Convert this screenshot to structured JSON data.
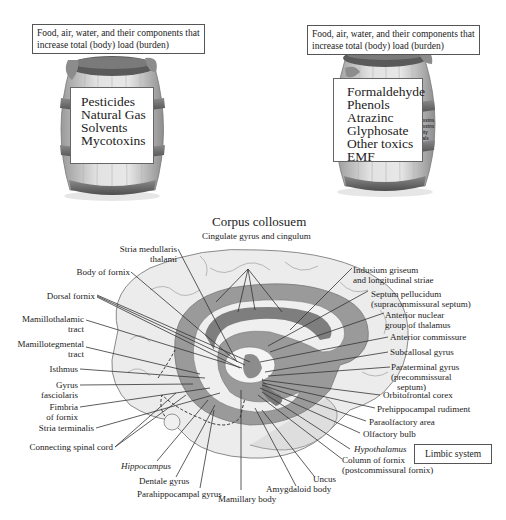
{
  "barrels": [
    {
      "caption": [
        "Food, air, water, and their components that",
        "increase total (body) load (burden)"
      ],
      "items": [
        "Pesticides",
        "Natural Gas",
        "Solvents",
        "Mycotoxins"
      ]
    },
    {
      "caption": [
        "Food, air, water, and their components that",
        "increase total (body) load (burden)"
      ],
      "items": [
        "Formaldehyde",
        "Phenols",
        "Atrazinc",
        "Glyphosate",
        "Other toxics",
        "EMF"
      ],
      "hidden_fragments": [
        "Toxins",
        "Toxins",
        "vity",
        "cals"
      ]
    }
  ],
  "brain": {
    "title": "Corpus collosuem",
    "subtitle": "Cingulate gyrus and cingulum",
    "legend": "Limbic system",
    "left_labels": [
      [
        "Stria medullaris",
        "thalami"
      ],
      [
        "Body of fornix"
      ],
      [
        "Dorsal fornix"
      ],
      [
        "Mamillothalamic",
        "tract"
      ],
      [
        "Mamillotegmental",
        "tract"
      ],
      [
        "Isthmus"
      ],
      [
        "Gyrus",
        "fasciolaris"
      ],
      [
        "Fimbria",
        "of fornix"
      ],
      [
        "Stria terminalis"
      ],
      [
        "Connecting spinal cord"
      ]
    ],
    "right_labels": [
      [
        "Indusium griseum",
        "and longitudinal striae"
      ],
      [
        "Septum pellucidum",
        "(supracommissural septum)"
      ],
      [
        "Anterior nuclear",
        "group of  thalamus"
      ],
      [
        "Anterior commissure"
      ],
      [
        "Subcallosal gyrus"
      ],
      [
        "Paraterminal gyrus",
        "(precommissural",
        "septum)"
      ],
      [
        "Orbitofrontal corex"
      ],
      [
        "Prehippocampal rudiment"
      ],
      [
        "Paraolfactory area"
      ],
      [
        "Olfactory bulb"
      ],
      [
        "Hypothalamus"
      ],
      [
        "Column of fornix",
        "(postcommissural fornix)"
      ]
    ],
    "bottom_labels": {
      "hippocampus": "Hippocampus",
      "dentale": "Dentale gyrus",
      "parahippocampal": "Parahippocampal gyrus",
      "mamillary": "Mamillary body",
      "amygdaloid": "Amygdaloid body",
      "uncus": "Uncus"
    }
  },
  "colors": {
    "barrel_wood": "#d8d8d8",
    "barrel_band": "#6e6e6e",
    "brain_cortex": "#ececec",
    "brain_limbic": "#9a9a9a",
    "brain_outline": "#8a8a8a",
    "leader_line": "#333333"
  }
}
